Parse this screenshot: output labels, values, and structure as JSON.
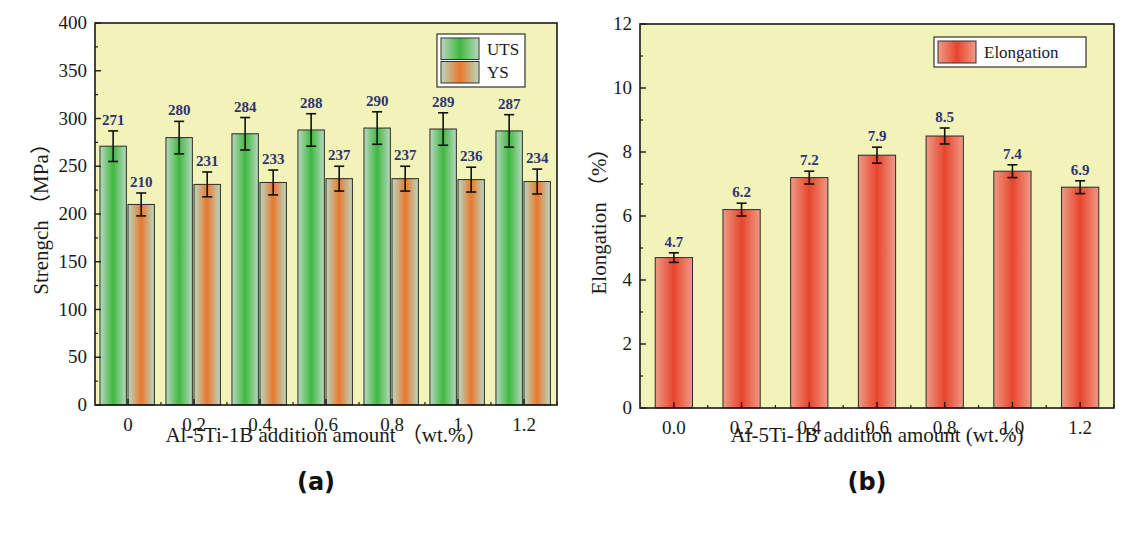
{
  "chart_data": [
    {
      "id": "a",
      "type": "bar",
      "panel_label": "(a)",
      "title": "",
      "xlabel": "Al-5Ti-1B addition amount （wt.%）",
      "ylabel": "Strengch （MPa）",
      "categories": [
        "0",
        "0.2",
        "0.4",
        "0.6",
        "0.8",
        "1",
        "1.2"
      ],
      "series": [
        {
          "name": "UTS",
          "values": [
            271,
            280,
            284,
            288,
            290,
            289,
            287
          ],
          "errors": [
            16,
            17,
            17,
            17,
            17,
            17,
            17
          ],
          "color": "#3fb83f"
        },
        {
          "name": "YS",
          "values": [
            210,
            231,
            233,
            237,
            237,
            236,
            234
          ],
          "errors": [
            12,
            13,
            13,
            13,
            13,
            13,
            13
          ],
          "color": "#e8792e"
        }
      ],
      "ylim": [
        0,
        400
      ],
      "yticks": [
        0,
        50,
        100,
        150,
        200,
        250,
        300,
        350,
        400
      ],
      "grid": false,
      "legend_position": "upper right",
      "background": "#f2f3b8"
    },
    {
      "id": "b",
      "type": "bar",
      "panel_label": "(b)",
      "title": "",
      "xlabel": "Al-5Ti-1B addition amount (wt.%)",
      "ylabel": "Elongation （%）",
      "categories": [
        "0.0",
        "0.2",
        "0.4",
        "0.6",
        "0.8",
        "1.0",
        "1.2"
      ],
      "series": [
        {
          "name": "Elongation",
          "values": [
            4.7,
            6.2,
            7.2,
            7.9,
            8.5,
            7.4,
            6.9
          ],
          "errors": [
            0.15,
            0.2,
            0.2,
            0.25,
            0.25,
            0.2,
            0.2
          ],
          "color": "#e8452c"
        }
      ],
      "value_labels": [
        "4.7",
        "6.2",
        "7.2",
        "7.9",
        "8.5",
        "7.4",
        "6.9"
      ],
      "ylim": [
        0,
        12
      ],
      "yticks": [
        0,
        2,
        4,
        6,
        8,
        10,
        12
      ],
      "grid": false,
      "legend_position": "upper right",
      "background": "#f2f3b8"
    }
  ]
}
